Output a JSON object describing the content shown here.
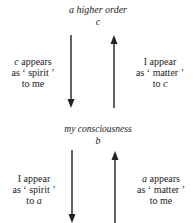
{
  "top_node": {
    "title": "a higher order",
    "label": "c"
  },
  "middle_node": {
    "title": "my consciousness",
    "label": "b"
  },
  "upper_left": {
    "line1_var": "c",
    "line1_rest": " appears",
    "line2": "as ‘ spirit ’",
    "line3": "to me"
  },
  "upper_right": {
    "line1": "I appear",
    "line2": "as ‘ matter ’",
    "line3_pre": "to ",
    "line3_var": "c"
  },
  "lower_left": {
    "line1": "I appear",
    "line2": "as ‘ spirit ’",
    "line3_pre": "to ",
    "line3_var": "a"
  },
  "lower_right": {
    "line1_var": "a",
    "line1_rest": " appears",
    "line2": "as ‘ matter ’",
    "line3": "to me"
  },
  "colors": {
    "ink": "#222222",
    "background": "#ffffff"
  }
}
